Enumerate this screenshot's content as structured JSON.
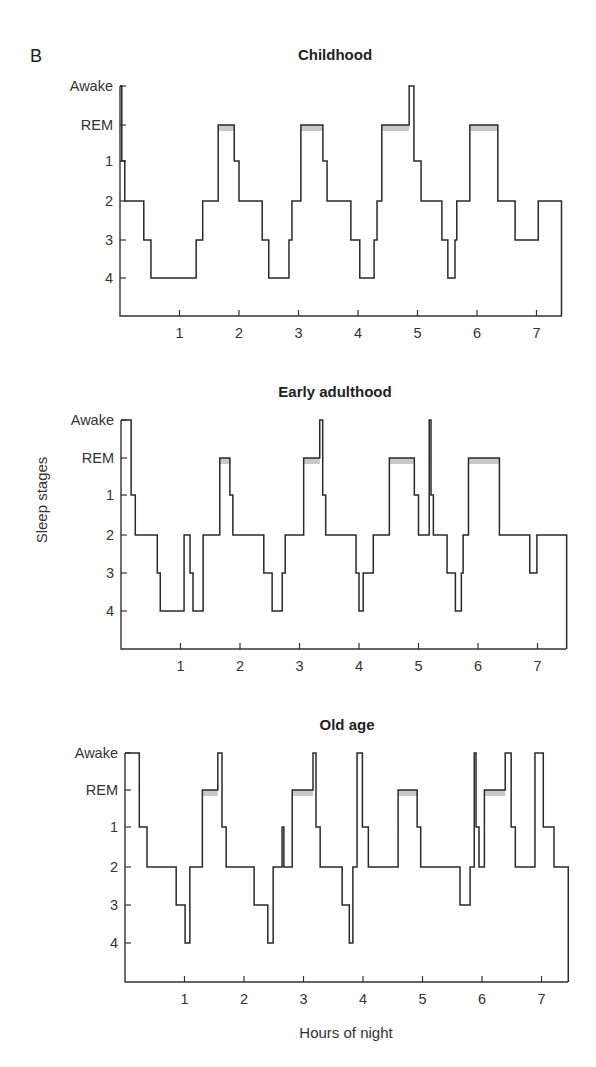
{
  "figure": {
    "panel_label": "B",
    "ylabel": "Sleep stages",
    "xlabel": "Hours of night",
    "colors": {
      "line": "#2a2a2a",
      "rem_shade": "#c9c9c9",
      "axis": "#333333"
    }
  },
  "chart_data": [
    {
      "type": "line",
      "subtype": "step",
      "title": "Childhood",
      "xlabel": "",
      "ylabel": "",
      "y_categories": [
        "Awake",
        "REM",
        "1",
        "2",
        "3",
        "4"
      ],
      "x_ticks": [
        1,
        2,
        3,
        4,
        5,
        6,
        7
      ],
      "xlim": [
        0,
        7.45
      ],
      "segments": [
        {
          "start": 0.0,
          "end": 0.03,
          "stage": "Awake"
        },
        {
          "start": 0.03,
          "end": 0.08,
          "stage": "1"
        },
        {
          "start": 0.08,
          "end": 0.4,
          "stage": "2"
        },
        {
          "start": 0.4,
          "end": 0.52,
          "stage": "3"
        },
        {
          "start": 0.52,
          "end": 1.28,
          "stage": "4"
        },
        {
          "start": 1.28,
          "end": 1.39,
          "stage": "3"
        },
        {
          "start": 1.39,
          "end": 1.65,
          "stage": "2"
        },
        {
          "start": 1.65,
          "end": 1.92,
          "stage": "REM"
        },
        {
          "start": 1.92,
          "end": 2.0,
          "stage": "1"
        },
        {
          "start": 2.0,
          "end": 2.39,
          "stage": "2"
        },
        {
          "start": 2.39,
          "end": 2.5,
          "stage": "3"
        },
        {
          "start": 2.5,
          "end": 2.84,
          "stage": "4"
        },
        {
          "start": 2.84,
          "end": 2.89,
          "stage": "3"
        },
        {
          "start": 2.89,
          "end": 3.04,
          "stage": "2"
        },
        {
          "start": 3.04,
          "end": 3.41,
          "stage": "REM"
        },
        {
          "start": 3.41,
          "end": 3.48,
          "stage": "1"
        },
        {
          "start": 3.48,
          "end": 3.88,
          "stage": "2"
        },
        {
          "start": 3.88,
          "end": 4.03,
          "stage": "3"
        },
        {
          "start": 4.03,
          "end": 4.27,
          "stage": "4"
        },
        {
          "start": 4.27,
          "end": 4.32,
          "stage": "3"
        },
        {
          "start": 4.32,
          "end": 4.4,
          "stage": "2"
        },
        {
          "start": 4.4,
          "end": 4.86,
          "stage": "REM"
        },
        {
          "start": 4.86,
          "end": 4.94,
          "stage": "Awake"
        },
        {
          "start": 4.94,
          "end": 5.06,
          "stage": "1"
        },
        {
          "start": 5.06,
          "end": 5.41,
          "stage": "2"
        },
        {
          "start": 5.41,
          "end": 5.51,
          "stage": "3"
        },
        {
          "start": 5.51,
          "end": 5.63,
          "stage": "4"
        },
        {
          "start": 5.63,
          "end": 5.66,
          "stage": "3"
        },
        {
          "start": 5.66,
          "end": 5.88,
          "stage": "2"
        },
        {
          "start": 5.88,
          "end": 6.35,
          "stage": "REM"
        },
        {
          "start": 6.35,
          "end": 6.64,
          "stage": "2"
        },
        {
          "start": 6.64,
          "end": 7.03,
          "stage": "3"
        },
        {
          "start": 7.03,
          "end": 7.42,
          "stage": "2"
        }
      ],
      "rem_shaded": [
        [
          1.65,
          1.92
        ],
        [
          3.04,
          3.41
        ],
        [
          4.4,
          4.86
        ],
        [
          5.88,
          6.35
        ]
      ]
    },
    {
      "type": "line",
      "subtype": "step",
      "title": "Early adulthood",
      "xlabel": "",
      "ylabel": "Sleep stages",
      "y_categories": [
        "Awake",
        "REM",
        "1",
        "2",
        "3",
        "4"
      ],
      "x_ticks": [
        1,
        2,
        3,
        4,
        5,
        6,
        7
      ],
      "xlim": [
        0,
        7.45
      ],
      "segments": [
        {
          "start": 0.0,
          "end": 0.17,
          "stage": "Awake"
        },
        {
          "start": 0.17,
          "end": 0.24,
          "stage": "1"
        },
        {
          "start": 0.24,
          "end": 0.61,
          "stage": "2"
        },
        {
          "start": 0.61,
          "end": 0.66,
          "stage": "3"
        },
        {
          "start": 0.66,
          "end": 1.06,
          "stage": "4"
        },
        {
          "start": 1.06,
          "end": 1.16,
          "stage": "2"
        },
        {
          "start": 1.16,
          "end": 1.21,
          "stage": "3"
        },
        {
          "start": 1.21,
          "end": 1.38,
          "stage": "4"
        },
        {
          "start": 1.38,
          "end": 1.66,
          "stage": "2"
        },
        {
          "start": 1.66,
          "end": 1.83,
          "stage": "REM"
        },
        {
          "start": 1.83,
          "end": 1.88,
          "stage": "1"
        },
        {
          "start": 1.88,
          "end": 2.4,
          "stage": "2"
        },
        {
          "start": 2.4,
          "end": 2.54,
          "stage": "3"
        },
        {
          "start": 2.54,
          "end": 2.71,
          "stage": "4"
        },
        {
          "start": 2.71,
          "end": 2.76,
          "stage": "3"
        },
        {
          "start": 2.76,
          "end": 3.07,
          "stage": "2"
        },
        {
          "start": 3.07,
          "end": 3.34,
          "stage": "REM"
        },
        {
          "start": 3.34,
          "end": 3.39,
          "stage": "Awake"
        },
        {
          "start": 3.39,
          "end": 3.44,
          "stage": "1"
        },
        {
          "start": 3.44,
          "end": 3.95,
          "stage": "2"
        },
        {
          "start": 3.95,
          "end": 4.0,
          "stage": "3"
        },
        {
          "start": 4.0,
          "end": 4.07,
          "stage": "4"
        },
        {
          "start": 4.07,
          "end": 4.24,
          "stage": "3"
        },
        {
          "start": 4.24,
          "end": 4.51,
          "stage": "2"
        },
        {
          "start": 4.51,
          "end": 4.93,
          "stage": "REM"
        },
        {
          "start": 4.93,
          "end": 5.0,
          "stage": "1"
        },
        {
          "start": 5.0,
          "end": 5.18,
          "stage": "2"
        },
        {
          "start": 5.18,
          "end": 5.21,
          "stage": "Awake"
        },
        {
          "start": 5.21,
          "end": 5.25,
          "stage": "1"
        },
        {
          "start": 5.25,
          "end": 5.48,
          "stage": "2"
        },
        {
          "start": 5.48,
          "end": 5.62,
          "stage": "3"
        },
        {
          "start": 5.62,
          "end": 5.72,
          "stage": "4"
        },
        {
          "start": 5.72,
          "end": 5.75,
          "stage": "3"
        },
        {
          "start": 5.75,
          "end": 5.84,
          "stage": "2"
        },
        {
          "start": 5.84,
          "end": 6.36,
          "stage": "REM"
        },
        {
          "start": 6.36,
          "end": 6.87,
          "stage": "2"
        },
        {
          "start": 6.87,
          "end": 6.99,
          "stage": "3"
        },
        {
          "start": 6.99,
          "end": 7.49,
          "stage": "2"
        }
      ],
      "rem_shaded": [
        [
          1.66,
          1.83
        ],
        [
          3.07,
          3.34
        ],
        [
          4.51,
          4.93
        ],
        [
          5.84,
          6.36
        ]
      ]
    },
    {
      "type": "line",
      "subtype": "step",
      "title": "Old age",
      "xlabel": "Hours of night",
      "ylabel": "",
      "y_categories": [
        "Awake",
        "REM",
        "1",
        "2",
        "3",
        "4"
      ],
      "x_ticks": [
        1,
        2,
        3,
        4,
        5,
        6,
        7
      ],
      "xlim": [
        0,
        7.45
      ],
      "segments": [
        {
          "start": 0.0,
          "end": 0.24,
          "stage": "Awake"
        },
        {
          "start": 0.24,
          "end": 0.37,
          "stage": "1"
        },
        {
          "start": 0.37,
          "end": 0.86,
          "stage": "2"
        },
        {
          "start": 0.86,
          "end": 1.01,
          "stage": "3"
        },
        {
          "start": 1.01,
          "end": 1.09,
          "stage": "4"
        },
        {
          "start": 1.09,
          "end": 1.3,
          "stage": "2"
        },
        {
          "start": 1.3,
          "end": 1.56,
          "stage": "REM"
        },
        {
          "start": 1.56,
          "end": 1.63,
          "stage": "Awake"
        },
        {
          "start": 1.63,
          "end": 1.7,
          "stage": "1"
        },
        {
          "start": 1.7,
          "end": 2.17,
          "stage": "2"
        },
        {
          "start": 2.17,
          "end": 2.4,
          "stage": "3"
        },
        {
          "start": 2.4,
          "end": 2.49,
          "stage": "4"
        },
        {
          "start": 2.49,
          "end": 2.64,
          "stage": "2"
        },
        {
          "start": 2.64,
          "end": 2.67,
          "stage": "1"
        },
        {
          "start": 2.67,
          "end": 2.81,
          "stage": "2"
        },
        {
          "start": 2.81,
          "end": 3.16,
          "stage": "REM"
        },
        {
          "start": 3.16,
          "end": 3.21,
          "stage": "Awake"
        },
        {
          "start": 3.21,
          "end": 3.28,
          "stage": "1"
        },
        {
          "start": 3.28,
          "end": 3.65,
          "stage": "2"
        },
        {
          "start": 3.65,
          "end": 3.77,
          "stage": "3"
        },
        {
          "start": 3.77,
          "end": 3.83,
          "stage": "4"
        },
        {
          "start": 3.83,
          "end": 3.9,
          "stage": "2"
        },
        {
          "start": 3.9,
          "end": 3.99,
          "stage": "Awake"
        },
        {
          "start": 3.99,
          "end": 4.09,
          "stage": "1"
        },
        {
          "start": 4.09,
          "end": 4.59,
          "stage": "2"
        },
        {
          "start": 4.59,
          "end": 4.91,
          "stage": "REM"
        },
        {
          "start": 4.91,
          "end": 4.97,
          "stage": "1"
        },
        {
          "start": 4.97,
          "end": 5.63,
          "stage": "2"
        },
        {
          "start": 5.63,
          "end": 5.8,
          "stage": "3"
        },
        {
          "start": 5.8,
          "end": 5.87,
          "stage": "2"
        },
        {
          "start": 5.87,
          "end": 5.9,
          "stage": "Awake"
        },
        {
          "start": 5.9,
          "end": 5.95,
          "stage": "1"
        },
        {
          "start": 5.95,
          "end": 6.04,
          "stage": "2"
        },
        {
          "start": 6.04,
          "end": 6.39,
          "stage": "REM"
        },
        {
          "start": 6.39,
          "end": 6.49,
          "stage": "Awake"
        },
        {
          "start": 6.49,
          "end": 6.56,
          "stage": "1"
        },
        {
          "start": 6.56,
          "end": 6.89,
          "stage": "2"
        },
        {
          "start": 6.89,
          "end": 7.03,
          "stage": "Awake"
        },
        {
          "start": 7.03,
          "end": 7.21,
          "stage": "1"
        },
        {
          "start": 7.21,
          "end": 7.45,
          "stage": "2"
        }
      ],
      "rem_shaded": [
        [
          1.3,
          1.56
        ],
        [
          2.81,
          3.16
        ],
        [
          4.59,
          4.91
        ],
        [
          6.04,
          6.39
        ]
      ]
    }
  ],
  "layout": {
    "panels": [
      {
        "x0": 120,
        "px_per_hour": 59.5,
        "right": 562,
        "bottom": 316,
        "y_ticks": [
          86,
          125,
          161,
          201,
          240,
          278
        ],
        "title_x": 335,
        "title_y": 60
      },
      {
        "x0": 121,
        "px_per_hour": 59.5,
        "right": 566,
        "bottom": 649,
        "y_ticks": [
          420,
          458,
          495,
          535,
          573,
          611
        ],
        "title_x": 335,
        "title_y": 397
      },
      {
        "x0": 125,
        "px_per_hour": 59.5,
        "right": 568,
        "bottom": 982,
        "y_ticks": [
          753,
          790,
          827,
          867,
          905,
          943
        ],
        "title_x": 347,
        "title_y": 730
      }
    ],
    "panel_label_pos": [
      30,
      62
    ],
    "ylabel_pos": [
      42,
      500
    ],
    "xlabel_pos": [
      346,
      1038
    ]
  }
}
